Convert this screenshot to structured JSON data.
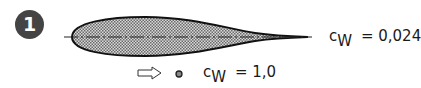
{
  "figure": {
    "number": "1",
    "airfoil": {
      "symbol": "c",
      "subscript": "W",
      "equals": "=",
      "value": "0,024"
    },
    "cylinder": {
      "symbol": "c",
      "subscript": "W",
      "equals": "=",
      "value": "1,0"
    },
    "flow_arrow_icon": "flow-direction-arrow",
    "colors": {
      "badge": "#444444",
      "outline": "#111111",
      "fill_hatch": "#9a9a9a"
    }
  }
}
